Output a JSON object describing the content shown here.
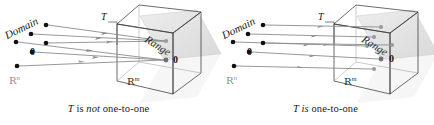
{
  "figure": {
    "panels": [
      {
        "id": "left",
        "caption_parts": {
          "t": "T",
          "is": " is ",
          "not": "not",
          "rest": " one-to-one"
        },
        "caption_full": "T is not one-to-one",
        "domain_label": "Domain",
        "range_label": "Range",
        "transform_label": "T",
        "domain_space_label": "R",
        "domain_space_exponent": "n",
        "codomain_space_label": "R",
        "codomain_space_exponent": "m",
        "zero_domain_label": "0",
        "zero_range_label": "0",
        "domain_points": [
          {
            "x": 46,
            "y": 25
          },
          {
            "x": 31,
            "y": 34
          },
          {
            "x": 16,
            "y": 42
          },
          {
            "x": 46,
            "y": 43
          },
          {
            "x": 32,
            "y": 52
          },
          {
            "x": 17,
            "y": 66
          }
        ],
        "range_points": [
          {
            "x": 166,
            "y": 41
          },
          {
            "x": 165,
            "y": 60
          }
        ],
        "arrows": [
          {
            "x1": 48,
            "y1": 25,
            "x2": 164,
            "y2": 41
          },
          {
            "x1": 33,
            "y1": 34,
            "x2": 164,
            "y2": 41
          },
          {
            "x1": 18,
            "y1": 42,
            "x2": 164,
            "y2": 60
          },
          {
            "x1": 48,
            "y1": 43,
            "x2": 164,
            "y2": 41
          },
          {
            "x1": 34,
            "y1": 52,
            "x2": 164,
            "y2": 60
          },
          {
            "x1": 19,
            "y1": 66,
            "x2": 164,
            "y2": 60
          }
        ]
      },
      {
        "id": "right",
        "caption_parts": {
          "t": "T",
          "is": " is",
          "not": "",
          "rest": " one-to-one"
        },
        "caption_full": "T is one-to-one",
        "domain_label": "Domain",
        "range_label": "Range",
        "transform_label": "T",
        "domain_space_label": "R",
        "domain_space_exponent": "n",
        "codomain_space_label": "R",
        "codomain_space_exponent": "m",
        "zero_domain_label": "0",
        "zero_range_label": "0",
        "domain_points": [
          {
            "x": 46,
            "y": 25
          },
          {
            "x": 31,
            "y": 34
          },
          {
            "x": 16,
            "y": 42
          },
          {
            "x": 46,
            "y": 43
          },
          {
            "x": 32,
            "y": 52
          },
          {
            "x": 17,
            "y": 66
          }
        ],
        "range_points": [
          {
            "x": 164,
            "y": 27
          },
          {
            "x": 157,
            "y": 37
          },
          {
            "x": 150,
            "y": 46
          },
          {
            "x": 175,
            "y": 45
          },
          {
            "x": 164,
            "y": 59
          },
          {
            "x": 157,
            "y": 69
          }
        ],
        "arrows": [
          {
            "x1": 48,
            "y1": 25,
            "x2": 162,
            "y2": 27
          },
          {
            "x1": 33,
            "y1": 34,
            "x2": 155,
            "y2": 37
          },
          {
            "x1": 18,
            "y1": 42,
            "x2": 148,
            "y2": 46
          },
          {
            "x1": 48,
            "y1": 43,
            "x2": 173,
            "y2": 45
          },
          {
            "x1": 34,
            "y1": 52,
            "x2": 162,
            "y2": 59
          },
          {
            "x1": 19,
            "y1": 66,
            "x2": 155,
            "y2": 69
          }
        ]
      }
    ],
    "colors": {
      "ink": "#1a1a1a",
      "arrow": "#8c8c8c",
      "dot_domain": "#111111",
      "dot_range": "#9a9a9a",
      "cube_line": "#3a3a3a",
      "plane_fill": "#e2e2e2",
      "background": "#ffffff"
    }
  }
}
